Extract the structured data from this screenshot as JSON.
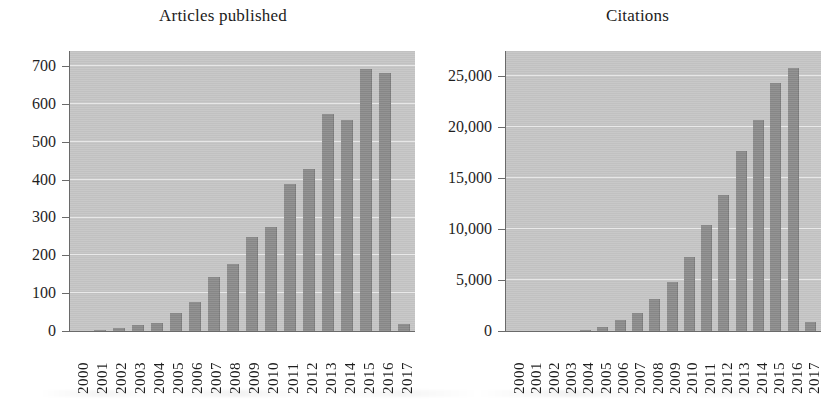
{
  "chart_data": [
    {
      "type": "bar",
      "title": "Articles published",
      "xlabel": "",
      "ylabel": "",
      "categories": [
        "2000",
        "2001",
        "2002",
        "2003",
        "2004",
        "2005",
        "2006",
        "2007",
        "2008",
        "2009",
        "2010",
        "2011",
        "2012",
        "2013",
        "2014",
        "2015",
        "2016",
        "2017"
      ],
      "values": [
        0,
        4,
        8,
        17,
        20,
        47,
        78,
        143,
        177,
        248,
        274,
        388,
        428,
        573,
        559,
        693,
        683,
        18
      ],
      "ylim": [
        0,
        740
      ],
      "yticks": [
        0,
        100,
        200,
        300,
        400,
        500,
        600,
        700
      ],
      "ytick_labels": [
        "0",
        "100",
        "200",
        "300",
        "400",
        "500",
        "600",
        "700"
      ],
      "grid": true,
      "legend": false,
      "bar_color": "#8d8d8d",
      "plot_background": "#c7c7c7"
    },
    {
      "type": "bar",
      "title": "Citations",
      "xlabel": "",
      "ylabel": "",
      "categories": [
        "2000",
        "2001",
        "2002",
        "2003",
        "2004",
        "2005",
        "2006",
        "2007",
        "2008",
        "2009",
        "2010",
        "2011",
        "2012",
        "2013",
        "2014",
        "2015",
        "2016",
        "2017"
      ],
      "values": [
        0,
        0,
        0,
        0,
        90,
        390,
        1050,
        1800,
        3150,
        4850,
        7300,
        10400,
        13400,
        17700,
        20700,
        24400,
        25800,
        900
      ],
      "ylim": [
        0,
        27500
      ],
      "yticks": [
        0,
        5000,
        10000,
        15000,
        20000,
        25000
      ],
      "ytick_labels": [
        "0",
        "5,000",
        "10,000",
        "15,000",
        "20,000",
        "25,000"
      ],
      "grid": true,
      "legend": false,
      "bar_color": "#8d8d8d",
      "plot_background": "#c7c7c7"
    }
  ]
}
